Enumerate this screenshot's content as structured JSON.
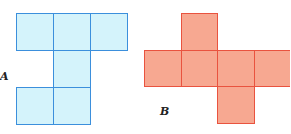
{
  "figures": [
    {
      "label": "A",
      "color_fill": "#d4f3fb",
      "color_stroke": "#3b8fdc",
      "cells": [
        [
          0,
          0
        ],
        [
          0,
          1
        ],
        [
          0,
          2
        ],
        [
          1,
          1
        ],
        [
          2,
          0
        ],
        [
          2,
          1
        ]
      ]
    },
    {
      "label": "B",
      "color_fill": "#f7a891",
      "color_stroke": "#e9533f",
      "cells": [
        [
          0,
          1
        ],
        [
          1,
          0
        ],
        [
          1,
          1
        ],
        [
          1,
          2
        ],
        [
          1,
          3
        ],
        [
          2,
          2
        ]
      ]
    }
  ]
}
